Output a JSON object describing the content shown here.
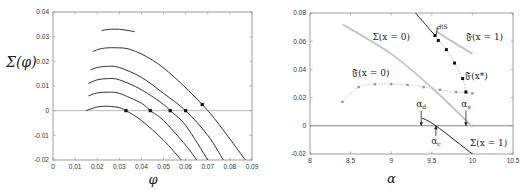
{
  "chart_data": [
    {
      "type": "line",
      "title": "",
      "xlabel": "φ",
      "ylabel": "Σ(φ)",
      "xlim": [
        0,
        0.09
      ],
      "ylim": [
        -0.02,
        0.04
      ],
      "xticks": [
        "0",
        "0.01",
        "0.02",
        "0.03",
        "0.04",
        "0.05",
        "0.06",
        "0.07",
        "0.08",
        "0.09"
      ],
      "yticks": [
        "0.04",
        "0.03",
        "0.02",
        "0.01",
        "0",
        "-0.01",
        "-0.02"
      ],
      "grid": false,
      "hline": 0,
      "series": [
        {
          "name": "curve-1",
          "x": [
            0.015,
            0.02,
            0.025,
            0.03,
            0.033,
            0.04,
            0.05,
            0.058
          ],
          "y": [
            0.0,
            0.0015,
            0.0018,
            0.0012,
            0.0,
            -0.004,
            -0.012,
            -0.02
          ],
          "marker_x": 0.033,
          "marker_y": 0.0
        },
        {
          "name": "curve-2",
          "x": [
            0.016,
            0.02,
            0.025,
            0.03,
            0.04,
            0.044,
            0.05,
            0.06,
            0.065
          ],
          "y": [
            0.006,
            0.0072,
            0.0075,
            0.007,
            0.003,
            0.0,
            -0.004,
            -0.014,
            -0.02
          ],
          "marker_x": 0.044,
          "marker_y": 0.0
        },
        {
          "name": "curve-3",
          "x": [
            0.016,
            0.02,
            0.025,
            0.03,
            0.04,
            0.05,
            0.053,
            0.06,
            0.07
          ],
          "y": [
            0.011,
            0.0125,
            0.013,
            0.0125,
            0.0085,
            0.0025,
            0.0,
            -0.006,
            -0.02
          ],
          "marker_x": 0.053,
          "marker_y": 0.0
        },
        {
          "name": "curve-4",
          "x": [
            0.017,
            0.02,
            0.025,
            0.03,
            0.04,
            0.05,
            0.06,
            0.07,
            0.077
          ],
          "y": [
            0.0165,
            0.0175,
            0.018,
            0.0175,
            0.0135,
            0.007,
            0.0,
            -0.01,
            -0.02
          ],
          "marker_x": 0.06,
          "marker_y": 0.0
        },
        {
          "name": "curve-5",
          "x": [
            0.018,
            0.022,
            0.028,
            0.035,
            0.045,
            0.055,
            0.0675,
            0.075,
            0.087
          ],
          "y": [
            0.024,
            0.0252,
            0.0255,
            0.0248,
            0.0205,
            0.0135,
            0.0025,
            -0.0055,
            -0.02
          ],
          "marker_x": 0.0675,
          "marker_y": 0.0025
        },
        {
          "name": "curve-6",
          "x": [
            0.022,
            0.026,
            0.03,
            0.034,
            0.037
          ],
          "y": [
            0.0325,
            0.033,
            0.033,
            0.0325,
            0.032
          ]
        }
      ]
    },
    {
      "type": "line",
      "title": "",
      "xlabel": "α",
      "ylabel": "",
      "xlim": [
        8,
        10.5
      ],
      "ylim": [
        -0.02,
        0.08
      ],
      "xticks": [
        "8",
        "8.5",
        "9",
        "9.5",
        "10",
        "10.5"
      ],
      "yticks": [
        "0.08",
        "0.06",
        "0.04",
        "0.02",
        "0",
        "-0.02"
      ],
      "grid": false,
      "hline": 0,
      "series": [
        {
          "name": "Σ(x = 0)",
          "style": "gray-thick",
          "x": [
            8.4,
            9.0,
            9.5,
            9.9,
            10.0
          ],
          "y": [
            0.072,
            0.051,
            0.027,
            0.005,
            -0.001
          ]
        },
        {
          "name": "𝔉(x = 0)",
          "style": "gray-dotted-markers",
          "x": [
            8.4,
            8.6,
            8.8,
            9.0,
            9.2,
            9.4,
            9.6,
            9.8,
            9.92,
            10.0
          ],
          "y": [
            0.017,
            0.0275,
            0.0295,
            0.0295,
            0.029,
            0.0275,
            0.0255,
            0.024,
            0.0235,
            0.023
          ]
        },
        {
          "name": "𝔉(x = 1)",
          "style": "gray-thick",
          "x": [
            9.55,
            10.0
          ],
          "y": [
            0.067,
            0.051
          ]
        },
        {
          "name": "f^RS",
          "style": "black",
          "x": [
            9.3,
            9.54
          ],
          "y": [
            0.08,
            0.064
          ]
        },
        {
          "name": "𝔉(x*)",
          "style": "black-markers",
          "x": [
            9.54,
            9.58,
            9.68,
            9.78,
            9.88,
            9.92
          ],
          "y": [
            0.064,
            0.0605,
            0.054,
            0.0445,
            0.0335,
            0.024
          ]
        },
        {
          "name": "Σ(x = 1)",
          "style": "black",
          "x": [
            9.38,
            9.55,
            10.0
          ],
          "y": [
            0.0055,
            0.0,
            -0.02
          ]
        }
      ],
      "annotations": [
        {
          "text": "Σ(x = 0)",
          "x": 9.0,
          "y": 0.061
        },
        {
          "text": "𝔉(x = 0)",
          "x": 8.75,
          "y": 0.035
        },
        {
          "text": "f",
          "superscript": "RS",
          "x": 9.62,
          "y": 0.066
        },
        {
          "text": "𝔉(x = 1)",
          "x": 10.15,
          "y": 0.061
        },
        {
          "text": "𝔉(x*)",
          "x": 10.05,
          "y": 0.033
        },
        {
          "text": "α_d",
          "x": 9.37,
          "y": 0.013,
          "arrow_to": [
            9.37,
            0.0
          ]
        },
        {
          "text": "α_s",
          "x": 9.92,
          "y": 0.013,
          "arrow_to": [
            9.92,
            0.0
          ]
        },
        {
          "text": "α_c",
          "x": 9.55,
          "y": -0.013,
          "arrow_to": [
            9.55,
            0.0
          ]
        },
        {
          "text": "Σ(x = 1)",
          "x": 10.2,
          "y": -0.014
        }
      ]
    }
  ],
  "labels": {
    "left_xlabel": "φ",
    "left_ylabel": "Σ(φ)",
    "right_xlabel": "α"
  }
}
